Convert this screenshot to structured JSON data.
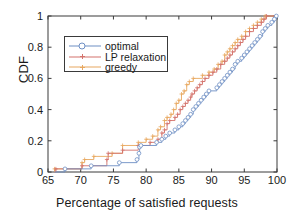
{
  "chart_data": {
    "type": "line",
    "subtype": "step-cdf",
    "title": "",
    "xlabel": "Percentage of satisfied requests",
    "ylabel": "CDF",
    "xlim": [
      65,
      100
    ],
    "ylim": [
      0,
      1
    ],
    "xticks": [
      65,
      70,
      75,
      80,
      85,
      90,
      95,
      100
    ],
    "yticks": [
      0,
      0.2,
      0.4,
      0.6,
      0.8,
      1
    ],
    "ytick_labels": [
      "0",
      "0.2",
      "0.4",
      "0.6",
      "0.8",
      "1"
    ],
    "xtick_labels": [
      "65",
      "70",
      "75",
      "80",
      "85",
      "90",
      "95",
      "100"
    ],
    "grid": false,
    "legend_position": "upper-left-inset",
    "colors": {
      "optimal": "#6e8fc4",
      "lp_relaxation": "#d4736c",
      "greedy": "#e8a860",
      "axis": "#3a3a3a",
      "text": "#1a1a1a",
      "background": "#ffffff"
    },
    "series": [
      {
        "name": "optimal",
        "color": "#6e8fc4",
        "marker": "circle",
        "points": [
          [
            66.0,
            0.0
          ],
          [
            67.6,
            0.0
          ],
          [
            67.6,
            0.02
          ],
          [
            71.6,
            0.02
          ],
          [
            71.6,
            0.04
          ],
          [
            75.9,
            0.04
          ],
          [
            75.9,
            0.06
          ],
          [
            78.6,
            0.06
          ],
          [
            78.6,
            0.08
          ],
          [
            78.9,
            0.08
          ],
          [
            78.9,
            0.12
          ],
          [
            79.0,
            0.12
          ],
          [
            79.0,
            0.16
          ],
          [
            79.2,
            0.16
          ],
          [
            79.2,
            0.17
          ],
          [
            81.6,
            0.17
          ],
          [
            81.6,
            0.19
          ],
          [
            82.4,
            0.19
          ],
          [
            82.4,
            0.21
          ],
          [
            83.0,
            0.21
          ],
          [
            83.0,
            0.23
          ],
          [
            83.6,
            0.23
          ],
          [
            83.6,
            0.25
          ],
          [
            84.4,
            0.25
          ],
          [
            84.4,
            0.27
          ],
          [
            85.0,
            0.27
          ],
          [
            85.0,
            0.29
          ],
          [
            85.6,
            0.29
          ],
          [
            85.6,
            0.31
          ],
          [
            86.0,
            0.31
          ],
          [
            86.0,
            0.33
          ],
          [
            86.4,
            0.33
          ],
          [
            86.4,
            0.35
          ],
          [
            86.8,
            0.35
          ],
          [
            86.8,
            0.37
          ],
          [
            87.2,
            0.37
          ],
          [
            87.2,
            0.4
          ],
          [
            87.6,
            0.4
          ],
          [
            87.6,
            0.42
          ],
          [
            88.0,
            0.42
          ],
          [
            88.0,
            0.44
          ],
          [
            88.4,
            0.44
          ],
          [
            88.4,
            0.46
          ],
          [
            88.8,
            0.46
          ],
          [
            88.8,
            0.48
          ],
          [
            89.2,
            0.48
          ],
          [
            89.2,
            0.5
          ],
          [
            89.6,
            0.5
          ],
          [
            89.6,
            0.52
          ],
          [
            90.8,
            0.52
          ],
          [
            90.8,
            0.54
          ],
          [
            91.2,
            0.54
          ],
          [
            91.2,
            0.56
          ],
          [
            91.6,
            0.56
          ],
          [
            91.6,
            0.58
          ],
          [
            92.0,
            0.58
          ],
          [
            92.0,
            0.6
          ],
          [
            92.4,
            0.6
          ],
          [
            92.4,
            0.62
          ],
          [
            92.8,
            0.62
          ],
          [
            92.8,
            0.64
          ],
          [
            93.2,
            0.64
          ],
          [
            93.2,
            0.66
          ],
          [
            93.6,
            0.66
          ],
          [
            93.6,
            0.69
          ],
          [
            94.0,
            0.69
          ],
          [
            94.0,
            0.71
          ],
          [
            94.6,
            0.71
          ],
          [
            94.6,
            0.73
          ],
          [
            95.0,
            0.73
          ],
          [
            95.0,
            0.75
          ],
          [
            95.4,
            0.75
          ],
          [
            95.4,
            0.77
          ],
          [
            95.8,
            0.77
          ],
          [
            95.8,
            0.79
          ],
          [
            96.2,
            0.79
          ],
          [
            96.2,
            0.81
          ],
          [
            96.6,
            0.81
          ],
          [
            96.6,
            0.83
          ],
          [
            97.0,
            0.83
          ],
          [
            97.0,
            0.85
          ],
          [
            97.4,
            0.85
          ],
          [
            97.4,
            0.87
          ],
          [
            97.8,
            0.87
          ],
          [
            97.8,
            0.9
          ],
          [
            98.2,
            0.9
          ],
          [
            98.2,
            0.92
          ],
          [
            98.6,
            0.92
          ],
          [
            98.6,
            0.94
          ],
          [
            99.2,
            0.94
          ],
          [
            99.2,
            0.96
          ],
          [
            99.6,
            0.96
          ],
          [
            99.6,
            0.98
          ],
          [
            99.9,
            0.98
          ],
          [
            99.9,
            1.0
          ]
        ]
      },
      {
        "name": "LP relaxation",
        "color": "#d4736c",
        "marker": "plus",
        "points": [
          [
            66.0,
            0.0
          ],
          [
            66.2,
            0.0
          ],
          [
            66.2,
            0.02
          ],
          [
            70.2,
            0.02
          ],
          [
            70.2,
            0.04
          ],
          [
            74.0,
            0.04
          ],
          [
            74.0,
            0.08
          ],
          [
            74.2,
            0.08
          ],
          [
            74.2,
            0.12
          ],
          [
            76.4,
            0.12
          ],
          [
            76.4,
            0.14
          ],
          [
            78.8,
            0.14
          ],
          [
            78.8,
            0.17
          ],
          [
            80.6,
            0.17
          ],
          [
            80.6,
            0.19
          ],
          [
            81.8,
            0.19
          ],
          [
            81.8,
            0.21
          ],
          [
            82.4,
            0.21
          ],
          [
            82.4,
            0.25
          ],
          [
            82.8,
            0.25
          ],
          [
            82.8,
            0.27
          ],
          [
            83.2,
            0.27
          ],
          [
            83.2,
            0.31
          ],
          [
            83.6,
            0.31
          ],
          [
            83.6,
            0.33
          ],
          [
            84.4,
            0.33
          ],
          [
            84.4,
            0.35
          ],
          [
            84.8,
            0.35
          ],
          [
            84.8,
            0.37
          ],
          [
            85.2,
            0.37
          ],
          [
            85.2,
            0.4
          ],
          [
            85.6,
            0.4
          ],
          [
            85.6,
            0.42
          ],
          [
            86.0,
            0.42
          ],
          [
            86.0,
            0.44
          ],
          [
            86.4,
            0.44
          ],
          [
            86.4,
            0.46
          ],
          [
            86.8,
            0.46
          ],
          [
            86.8,
            0.48
          ],
          [
            87.0,
            0.48
          ],
          [
            87.0,
            0.5
          ],
          [
            87.4,
            0.5
          ],
          [
            87.4,
            0.52
          ],
          [
            87.8,
            0.52
          ],
          [
            87.8,
            0.54
          ],
          [
            88.2,
            0.54
          ],
          [
            88.2,
            0.56
          ],
          [
            88.6,
            0.56
          ],
          [
            88.6,
            0.58
          ],
          [
            89.0,
            0.58
          ],
          [
            89.0,
            0.6
          ],
          [
            89.6,
            0.6
          ],
          [
            89.6,
            0.62
          ],
          [
            90.2,
            0.62
          ],
          [
            90.2,
            0.64
          ],
          [
            90.8,
            0.64
          ],
          [
            90.8,
            0.66
          ],
          [
            91.4,
            0.66
          ],
          [
            91.4,
            0.69
          ],
          [
            92.0,
            0.69
          ],
          [
            92.0,
            0.71
          ],
          [
            92.4,
            0.71
          ],
          [
            92.4,
            0.73
          ],
          [
            92.8,
            0.73
          ],
          [
            92.8,
            0.75
          ],
          [
            93.2,
            0.75
          ],
          [
            93.2,
            0.77
          ],
          [
            93.6,
            0.77
          ],
          [
            93.6,
            0.79
          ],
          [
            94.0,
            0.79
          ],
          [
            94.0,
            0.81
          ],
          [
            94.4,
            0.81
          ],
          [
            94.4,
            0.83
          ],
          [
            94.8,
            0.83
          ],
          [
            94.8,
            0.85
          ],
          [
            95.2,
            0.85
          ],
          [
            95.2,
            0.87
          ],
          [
            95.8,
            0.87
          ],
          [
            95.8,
            0.9
          ],
          [
            96.4,
            0.9
          ],
          [
            96.4,
            0.92
          ],
          [
            97.0,
            0.92
          ],
          [
            97.0,
            0.94
          ],
          [
            97.6,
            0.94
          ],
          [
            97.6,
            0.96
          ],
          [
            98.0,
            0.96
          ],
          [
            98.0,
            0.98
          ],
          [
            98.4,
            0.98
          ],
          [
            98.4,
            1.0
          ],
          [
            100.0,
            1.0
          ]
        ]
      },
      {
        "name": "greedy",
        "color": "#e8a860",
        "marker": "plus",
        "points": [
          [
            66.0,
            0.0
          ],
          [
            66.0,
            0.02
          ],
          [
            70.2,
            0.02
          ],
          [
            70.2,
            0.06
          ],
          [
            70.6,
            0.06
          ],
          [
            70.6,
            0.08
          ],
          [
            72.0,
            0.08
          ],
          [
            72.0,
            0.1
          ],
          [
            74.8,
            0.1
          ],
          [
            74.8,
            0.12
          ],
          [
            76.4,
            0.12
          ],
          [
            76.4,
            0.17
          ],
          [
            78.8,
            0.17
          ],
          [
            78.8,
            0.19
          ],
          [
            80.0,
            0.19
          ],
          [
            80.0,
            0.21
          ],
          [
            81.0,
            0.21
          ],
          [
            81.0,
            0.23
          ],
          [
            81.8,
            0.23
          ],
          [
            81.8,
            0.27
          ],
          [
            82.2,
            0.27
          ],
          [
            82.2,
            0.29
          ],
          [
            82.8,
            0.29
          ],
          [
            82.8,
            0.33
          ],
          [
            83.2,
            0.33
          ],
          [
            83.2,
            0.35
          ],
          [
            83.8,
            0.35
          ],
          [
            83.8,
            0.37
          ],
          [
            84.2,
            0.37
          ],
          [
            84.2,
            0.4
          ],
          [
            84.6,
            0.4
          ],
          [
            84.6,
            0.44
          ],
          [
            85.0,
            0.44
          ],
          [
            85.0,
            0.46
          ],
          [
            85.4,
            0.46
          ],
          [
            85.4,
            0.5
          ],
          [
            85.8,
            0.5
          ],
          [
            85.8,
            0.52
          ],
          [
            86.2,
            0.52
          ],
          [
            86.2,
            0.56
          ],
          [
            86.6,
            0.56
          ],
          [
            86.6,
            0.58
          ],
          [
            87.2,
            0.58
          ],
          [
            87.2,
            0.6
          ],
          [
            88.6,
            0.6
          ],
          [
            88.6,
            0.62
          ],
          [
            89.6,
            0.62
          ],
          [
            89.6,
            0.64
          ],
          [
            90.4,
            0.64
          ],
          [
            90.4,
            0.66
          ],
          [
            91.0,
            0.66
          ],
          [
            91.0,
            0.69
          ],
          [
            91.6,
            0.69
          ],
          [
            91.6,
            0.71
          ],
          [
            92.0,
            0.71
          ],
          [
            92.0,
            0.75
          ],
          [
            92.4,
            0.75
          ],
          [
            92.4,
            0.77
          ],
          [
            92.8,
            0.77
          ],
          [
            92.8,
            0.79
          ],
          [
            93.2,
            0.79
          ],
          [
            93.2,
            0.81
          ],
          [
            93.6,
            0.81
          ],
          [
            93.6,
            0.83
          ],
          [
            94.0,
            0.83
          ],
          [
            94.0,
            0.85
          ],
          [
            94.6,
            0.85
          ],
          [
            94.6,
            0.87
          ],
          [
            95.2,
            0.87
          ],
          [
            95.2,
            0.9
          ],
          [
            95.8,
            0.9
          ],
          [
            95.8,
            0.92
          ],
          [
            96.4,
            0.92
          ],
          [
            96.4,
            0.94
          ],
          [
            97.0,
            0.94
          ],
          [
            97.0,
            0.96
          ],
          [
            97.6,
            0.96
          ],
          [
            97.6,
            0.98
          ],
          [
            98.2,
            0.98
          ],
          [
            98.2,
            1.0
          ],
          [
            100.0,
            1.0
          ]
        ]
      }
    ],
    "legend": [
      {
        "label": "optimal",
        "color": "#6e8fc4",
        "marker": "circle"
      },
      {
        "label": "LP relaxation",
        "color": "#d4736c",
        "marker": "plus"
      },
      {
        "label": "greedy",
        "color": "#e8a860",
        "marker": "plus"
      }
    ]
  }
}
